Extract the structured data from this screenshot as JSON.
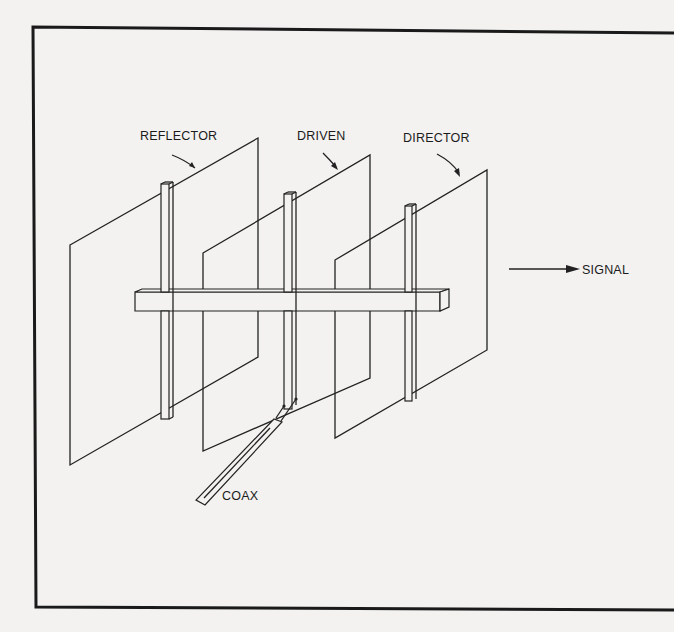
{
  "figure": {
    "labels": {
      "reflector": "REFLECTOR",
      "driven": "DRIVEN",
      "director": "DIRECTOR",
      "signal": "SIGNAL",
      "coax": "COAX"
    },
    "elements": [
      {
        "name": "reflector",
        "label": "REFLECTOR"
      },
      {
        "name": "driven",
        "label": "DRIVEN"
      },
      {
        "name": "director",
        "label": "DIRECTOR"
      }
    ],
    "signal_direction": "right",
    "colors": {
      "ink": "#222222",
      "paper": "#f3f2f0"
    }
  }
}
